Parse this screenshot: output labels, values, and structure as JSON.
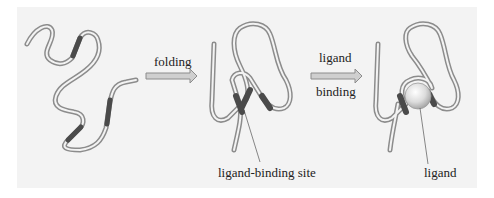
{
  "figure": {
    "type": "protein folding and ligand binding schematic",
    "background_color": "#f3f3f3",
    "chain_color": "#8c8c8c",
    "segment_color": "#4a4a4a",
    "ligand_color": "#d9d9d9",
    "stages": [
      {
        "id": "unfolded",
        "description": "unfolded polypeptide chain with three dark segments"
      },
      {
        "id": "folded",
        "description": "folded chain forming ligand-binding site"
      },
      {
        "id": "bound",
        "description": "folded chain with ligand bound"
      }
    ],
    "arrows": [
      {
        "label_top": "folding",
        "label_bottom": ""
      },
      {
        "label_top": "ligand",
        "label_bottom": "binding"
      }
    ],
    "labels": {
      "binding_site": "ligand-binding site",
      "ligand": "ligand"
    }
  }
}
